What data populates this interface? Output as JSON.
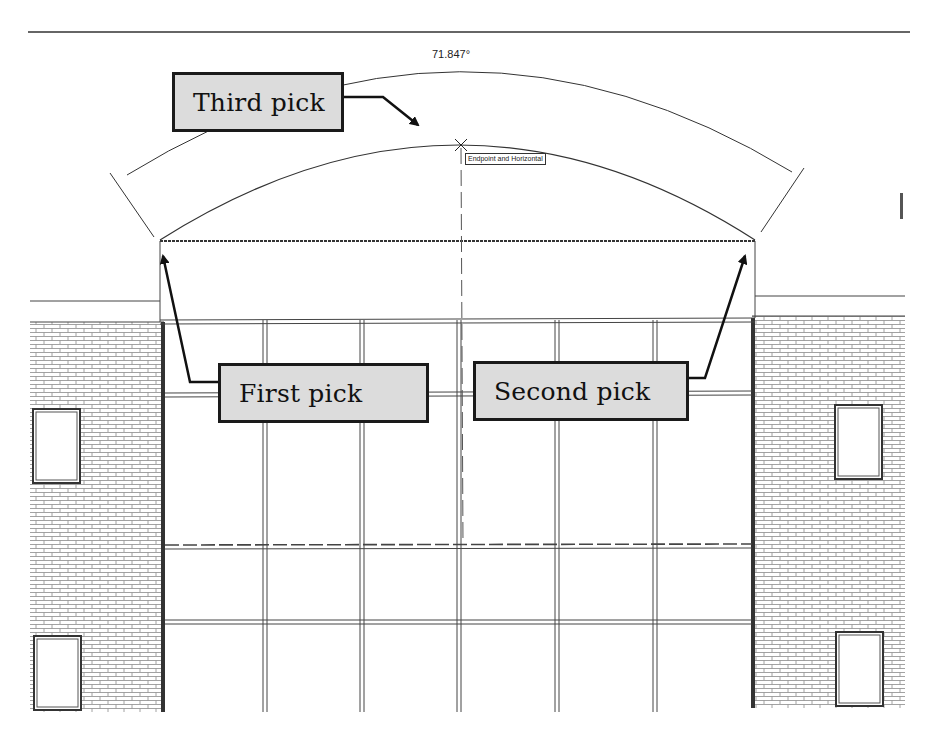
{
  "drawing": {
    "dimension": {
      "angle_label": "71.847°",
      "snap_tooltip": "Endpoint and Horizontal"
    },
    "callouts": [
      {
        "id": "third",
        "label": "Third pick"
      },
      {
        "id": "first",
        "label": "First pick"
      },
      {
        "id": "second",
        "label": "Second pick"
      }
    ],
    "colors": {
      "line": "#1a1a1a",
      "callout_fill": "#dcdcdc",
      "brick_line": "#777777",
      "background": "#ffffff"
    }
  }
}
